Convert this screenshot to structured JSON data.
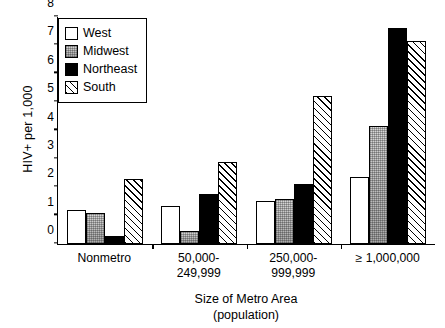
{
  "chart_data": {
    "type": "bar",
    "title": "",
    "xlabel": "Size of Metro Area\n(population)",
    "ylabel": "HIV+ per 1,000",
    "ylim": [
      0,
      8
    ],
    "yticks": [
      0,
      1,
      2,
      3,
      4,
      5,
      6,
      7,
      8
    ],
    "grid": false,
    "legend_position": "top-left",
    "categories": [
      "Nonmetro",
      "50,000-\n249,999",
      "250,000-\n999,999",
      "≥ 1,000,000"
    ],
    "series": [
      {
        "name": "West",
        "fill": "white",
        "values": [
          1.2,
          1.35,
          1.5,
          2.35
        ]
      },
      {
        "name": "Midwest",
        "fill": "gray-speckle",
        "values": [
          1.1,
          0.45,
          1.6,
          4.15
        ]
      },
      {
        "name": "Northeast",
        "fill": "black",
        "values": [
          0.3,
          1.75,
          2.1,
          7.6
        ]
      },
      {
        "name": "South",
        "fill": "diagonal-hatch",
        "values": [
          2.3,
          2.9,
          5.2,
          7.15
        ]
      }
    ]
  }
}
